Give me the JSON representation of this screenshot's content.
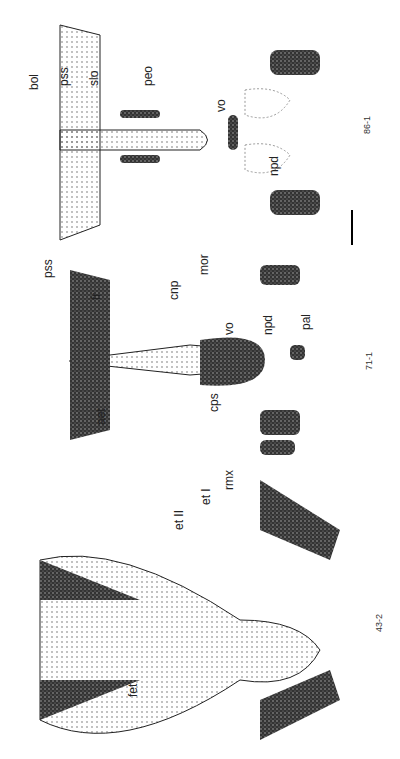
{
  "figure": {
    "orientation": "rotated 90deg (labels read bottom-to-top)",
    "panels": [
      {
        "id": "86-1",
        "section_label": "86-1",
        "labels": [
          "bol",
          "pss",
          "slo",
          "peo",
          "vo",
          "npd"
        ]
      },
      {
        "id": "71-1",
        "section_label": "71-1",
        "labels": [
          "pss",
          "fr",
          "cnp",
          "mor",
          "aet",
          "vo",
          "cps",
          "npd",
          "pal"
        ]
      },
      {
        "id": "43-2",
        "section_label": "43-2",
        "labels": [
          "fet",
          "et II",
          "et I",
          "rmx"
        ]
      }
    ],
    "scale_bar": true
  }
}
